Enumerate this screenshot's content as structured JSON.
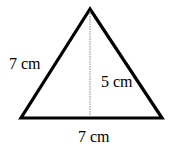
{
  "diagram": {
    "shape": "triangle",
    "labels": {
      "left_side": "7 cm",
      "height": "5 cm",
      "base": "7 cm"
    },
    "colors": {
      "stroke": "#000000",
      "height_line": "#888888",
      "background": "#ffffff"
    }
  }
}
